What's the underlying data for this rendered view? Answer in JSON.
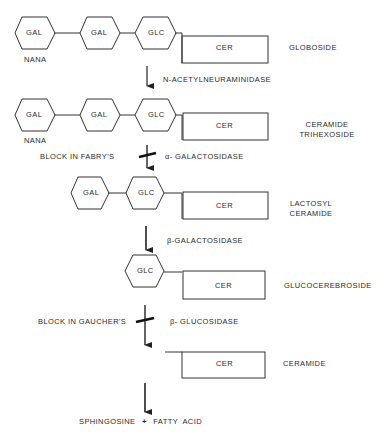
{
  "diagram": {
    "type": "metabolic-pathway",
    "rows": [
      {
        "molecule": "GLOBOSIDE",
        "sugars": [
          "GAL",
          "GAL",
          "GLC"
        ],
        "branch": "NANA",
        "lipid": "CER"
      },
      {
        "molecule": "CERAMIDE TRIHEXOSIDE",
        "molecule_lines": [
          "CERAMIDE",
          "TRIHEXOSIDE"
        ],
        "sugars": [
          "GAL",
          "GAL",
          "GLC"
        ],
        "branch": "NANA",
        "lipid": "CER"
      },
      {
        "molecule": "LACTOSYL CERAMIDE",
        "molecule_lines": [
          "LACTOSYL",
          "CERAMIDE"
        ],
        "sugars": [
          "GAL",
          "GLC"
        ],
        "lipid": "CER"
      },
      {
        "molecule": "GLUCOCEREBROSIDE",
        "sugars": [
          "GLC"
        ],
        "lipid": "CER"
      },
      {
        "molecule": "CERAMIDE",
        "sugars": [],
        "lipid": "CER"
      }
    ],
    "steps": [
      {
        "enzyme": "N-ACETYLNEURAMINIDASE",
        "block": null
      },
      {
        "enzyme": "α- GALACTOSIDASE",
        "block": "BLOCK IN FABRY'S"
      },
      {
        "enzyme": "β-GALACTOSIDASE",
        "block": null
      },
      {
        "enzyme": "β- GLUCOSIDASE",
        "block": "BLOCK IN GAUCHER'S"
      },
      {
        "enzyme": "",
        "block": null
      }
    ],
    "products": {
      "left": "SPHINGOSINE",
      "plus": "+",
      "right": "FATTY  ACID"
    }
  }
}
